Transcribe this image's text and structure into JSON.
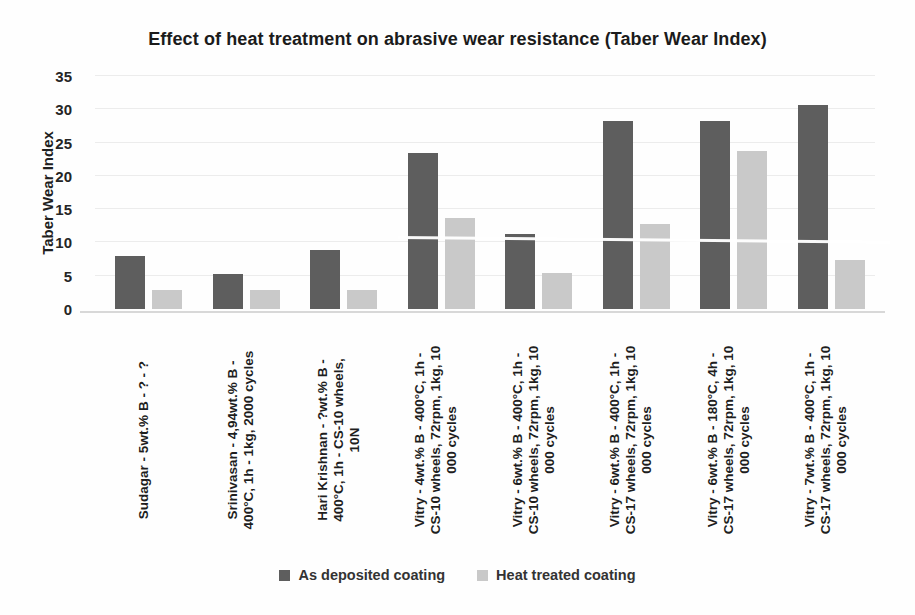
{
  "chart_data": {
    "type": "bar",
    "title": "Effect of heat treatment on abrasive wear resistance (Taber Wear Index)",
    "xlabel": "",
    "ylabel": "Taber Wear Index",
    "ylim": [
      0,
      35
    ],
    "yticks": [
      0,
      5,
      10,
      15,
      20,
      25,
      30,
      35
    ],
    "grid": true,
    "legend_position": "bottom",
    "categories": [
      "Sudagar - 5wt.% B - ? - ?",
      "Srinivasan - 4,94wt.% B -\n400°C, 1h - 1kg, 2000 cycles",
      "Hari Krishnan - ?wt.% B -\n400°C, 1h - CS-10 wheels,\n10N",
      "Vitry - 4wt.% B - 400°C, 1h -\nCS-10 wheels, 72rpm, 1kg, 10\n000 cycles",
      "Vitry - 6wt.% B - 400°C, 1h -\nCS-10 wheels, 72rpm, 1kg, 10\n000 cycles",
      "Vitry - 6wt.% B - 400°C, 1h -\nCS-17 wheels, 72rpm, 1kg, 10\n000 cycles",
      "Vitry - 6wt.% B - 180°C, 4h -\nCS-17 wheels, 72rpm, 1kg, 10\n000 cycles",
      "Vitry - 7wt.% B - 400°C, 1h -\nCS-17 wheels, 72rpm, 1kg, 10\n000 cycles"
    ],
    "series": [
      {
        "name": "As deposited coating",
        "color": "#5e5e5e",
        "values": [
          8.0,
          5.3,
          8.9,
          23.5,
          11.3,
          28.2,
          28.3,
          30.7
        ]
      },
      {
        "name": "Heat treated coating",
        "color": "#c9c9c9",
        "values": [
          2.9,
          2.9,
          2.8,
          13.7,
          5.4,
          12.7,
          23.7,
          7.4
        ]
      }
    ]
  },
  "colors": {
    "as_deposited": "#5e5e5e",
    "heat_treated": "#c9c9c9",
    "gridline": "#ececec",
    "axis_line": "#d8d8d8",
    "text": "#1e1e1e"
  }
}
